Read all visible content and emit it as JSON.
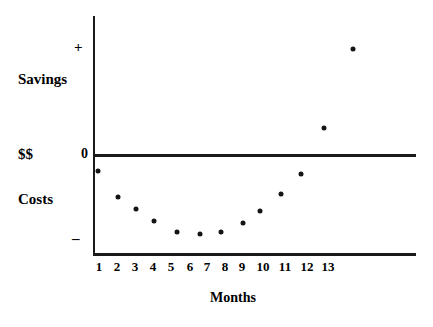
{
  "chart_data": {
    "type": "scatter",
    "title": "",
    "xlabel": "Months",
    "ylabel": "$$",
    "x_tick_labels": [
      "1",
      "2",
      "3",
      "4",
      "5",
      "6",
      "7",
      "8",
      "9",
      "10",
      "11",
      "12",
      "13"
    ],
    "y_tick_labels": [
      "+",
      "0",
      "–"
    ],
    "y_axis_annotations": [
      "Savings",
      "$$",
      "Costs"
    ],
    "axis_label_plus": "+",
    "axis_label_minus": "–",
    "axis_label_zero": "0",
    "axis_label_savings": "Savings",
    "axis_label_dollars": "$$",
    "axis_label_costs": "Costs",
    "xlim": [
      0.5,
      14.5
    ],
    "ylim": [
      -1.0,
      1.0
    ],
    "grid": false,
    "legend": null,
    "zero_line": 0,
    "point_color": "#141414",
    "axis_color": "#1a1a1a",
    "background_color": "#ffffff",
    "series": [
      {
        "name": "Net cash flow",
        "x": [
          1,
          2,
          3,
          4,
          5,
          6,
          7,
          8,
          9,
          10,
          11,
          12,
          13,
          14
        ],
        "values": [
          -0.16,
          -0.43,
          -0.55,
          -0.67,
          -0.78,
          -0.8,
          -0.78,
          -0.69,
          -0.57,
          -0.4,
          -0.16,
          0.2,
          0.81,
          0.81
        ],
        "pixel_points": [
          {
            "x": 98,
            "y": 171
          },
          {
            "x": 118,
            "y": 197
          },
          {
            "x": 136,
            "y": 209
          },
          {
            "x": 154,
            "y": 221
          },
          {
            "x": 177,
            "y": 232
          },
          {
            "x": 200,
            "y": 234
          },
          {
            "x": 221,
            "y": 232
          },
          {
            "x": 243,
            "y": 223
          },
          {
            "x": 260,
            "y": 211
          },
          {
            "x": 281,
            "y": 194
          },
          {
            "x": 301,
            "y": 174
          },
          {
            "x": 352,
            "y": 48
          }
        ]
      }
    ],
    "points": [
      {
        "month": 1,
        "value": -0.16,
        "px": 98,
        "py": 171
      },
      {
        "month": 2,
        "value": -0.43,
        "px": 118,
        "py": 197
      },
      {
        "month": 3,
        "value": -0.55,
        "px": 136,
        "py": 209
      },
      {
        "month": 4,
        "value": -0.67,
        "px": 154,
        "py": 221
      },
      {
        "month": 5,
        "value": -0.78,
        "px": 177,
        "py": 232
      },
      {
        "month": 6,
        "value": -0.8,
        "px": 200,
        "py": 234
      },
      {
        "month": 7,
        "value": -0.78,
        "px": 221,
        "py": 232
      },
      {
        "month": 8,
        "value": -0.69,
        "px": 243,
        "py": 223
      },
      {
        "month": 9,
        "value": -0.57,
        "px": 260,
        "py": 211
      },
      {
        "month": 10,
        "value": -0.4,
        "px": 281,
        "py": 194
      },
      {
        "month": 11,
        "value": -0.2,
        "px": 301,
        "py": 174
      },
      {
        "month": 12,
        "value": 0.23,
        "px": 324,
        "py": 128
      },
      {
        "month": 13,
        "value": 0.8,
        "px": 353,
        "py": 49
      }
    ]
  },
  "x_ticks": [
    {
      "label": "1",
      "px": 99
    },
    {
      "label": "2",
      "px": 117
    },
    {
      "label": "3",
      "px": 135
    },
    {
      "label": "4",
      "px": 153
    },
    {
      "label": "5",
      "px": 171
    },
    {
      "label": "6",
      "px": 190
    },
    {
      "label": "7",
      "px": 207
    },
    {
      "label": "8",
      "px": 225
    },
    {
      "label": "9",
      "px": 242
    },
    {
      "label": "10",
      "px": 263
    },
    {
      "label": "11",
      "px": 285
    },
    {
      "label": "12",
      "px": 307
    },
    {
      "label": "13",
      "px": 328
    }
  ]
}
